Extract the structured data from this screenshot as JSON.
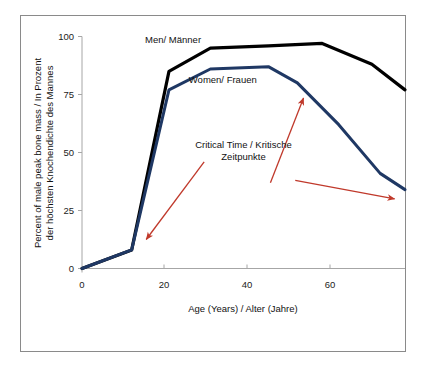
{
  "figure": {
    "background_color": "#ffffff",
    "frame_color": "#8a8a8a"
  },
  "chart_data": {
    "type": "line",
    "title": "",
    "xlabel": "Age (Years) / Alter (Jahre)",
    "ylabel": "Percent of male peak bone mass / In Prozent der höchsten Knochendichte des Mannes",
    "ylabel_line1": "Percent of male peak bone mass / In Prozent",
    "ylabel_line2": "der höchsten Knochendichte des Mannes",
    "xlim": [
      0,
      78
    ],
    "ylim": [
      0,
      100
    ],
    "xticks": [
      0,
      20,
      40,
      60
    ],
    "yticks": [
      0,
      25,
      50,
      75,
      100
    ],
    "xticklabels": [
      "0",
      "20",
      "40",
      "60"
    ],
    "yticklabels": [
      "0",
      "25",
      "50",
      "75",
      "100"
    ],
    "grid": false,
    "legend_position": "inline-labels",
    "series": [
      {
        "name": "Men/ Männer",
        "color": "#000000",
        "line_width": 3.2,
        "label_x": 22,
        "label_y": 97,
        "x": [
          0,
          12,
          21,
          31,
          45,
          58,
          70,
          78
        ],
        "values": [
          0,
          8,
          85,
          95,
          96,
          97,
          88,
          77
        ]
      },
      {
        "name": "Women/ Frauen",
        "color": "#1f3864",
        "line_width": 3.0,
        "label_x": 34,
        "label_y": 80,
        "x": [
          0,
          12,
          21,
          31,
          45,
          52,
          62,
          72,
          78
        ],
        "values": [
          0,
          8,
          77,
          86,
          87,
          80,
          62,
          41,
          34
        ]
      }
    ],
    "annotations": [
      {
        "text_line1": "Critical Time / Kritische",
        "text_line2": "Zeitpunkte",
        "color": "#c0392b",
        "text_x": 39,
        "text_y": 52
      }
    ],
    "arrows": [
      {
        "name": "arrow-to-puberty",
        "color": "#c0392b",
        "from": [
          29.5,
          46
        ],
        "to": [
          15.5,
          12.5
        ]
      },
      {
        "name": "arrow-to-menopause",
        "color": "#c0392b",
        "from": [
          45.5,
          37
        ],
        "to": [
          53.5,
          73.5
        ]
      },
      {
        "name": "arrow-to-old-age",
        "color": "#c0392b",
        "from": [
          51.5,
          38
        ],
        "to": [
          75.5,
          30
        ]
      }
    ]
  }
}
